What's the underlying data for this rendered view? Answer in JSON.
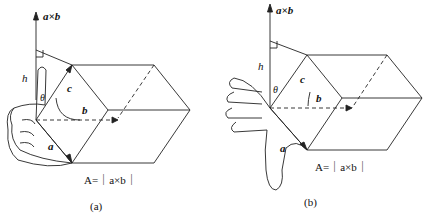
{
  "figures": [
    {
      "id": "a",
      "axis_label": "a×b",
      "height_label": "h",
      "angle_label": "θ",
      "vector_labels": {
        "a": "a",
        "b": "b",
        "c": "c"
      },
      "area_formula": "A=｜a×b｜",
      "caption": "(a)",
      "hand": "thumb-up"
    },
    {
      "id": "b",
      "axis_label": "a×b",
      "height_label": "h",
      "angle_label": "θ",
      "vector_labels": {
        "a": "a",
        "b": "b",
        "c": "c"
      },
      "area_formula": "A=｜a×b｜",
      "caption": "(b)",
      "hand": "thumb-down"
    }
  ],
  "colors": {
    "line": "#222222",
    "background": "#ffffff"
  }
}
